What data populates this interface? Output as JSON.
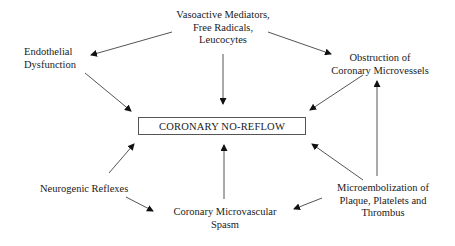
{
  "diagram": {
    "type": "cause-effect flow diagram",
    "center": {
      "id": "no_reflow",
      "label": "CORONARY NO-REFLOW"
    },
    "nodes": {
      "vasoactive": {
        "lines": [
          "Vasoactive Mediators,",
          "Free Radicals,",
          "Leucocytes"
        ]
      },
      "endothelial": {
        "lines": [
          "Endothelial",
          "Dysfunction"
        ]
      },
      "obstruction": {
        "lines": [
          "Obstruction of",
          "Coronary Microvessels"
        ]
      },
      "neurogenic": {
        "lines": [
          "Neurogenic Reflexes"
        ]
      },
      "spasm": {
        "lines": [
          "Coronary Microvascular",
          "Spasm"
        ]
      },
      "microembolization": {
        "lines": [
          "Microembolization of",
          "Plaque, Platelets and",
          "Thrombus"
        ]
      }
    },
    "edges": [
      {
        "from": "vasoactive",
        "to": "endothelial"
      },
      {
        "from": "vasoactive",
        "to": "obstruction"
      },
      {
        "from": "vasoactive",
        "to": "no_reflow"
      },
      {
        "from": "endothelial",
        "to": "no_reflow"
      },
      {
        "from": "obstruction",
        "to": "no_reflow"
      },
      {
        "from": "neurogenic",
        "to": "no_reflow"
      },
      {
        "from": "neurogenic",
        "to": "spasm"
      },
      {
        "from": "spasm",
        "to": "no_reflow"
      },
      {
        "from": "microembolization",
        "to": "no_reflow"
      },
      {
        "from": "microembolization",
        "to": "obstruction"
      },
      {
        "from": "microembolization",
        "to": "spasm"
      }
    ],
    "colors": {
      "line": "#555555",
      "text": "#1a1a1a",
      "background": "#ffffff"
    }
  }
}
